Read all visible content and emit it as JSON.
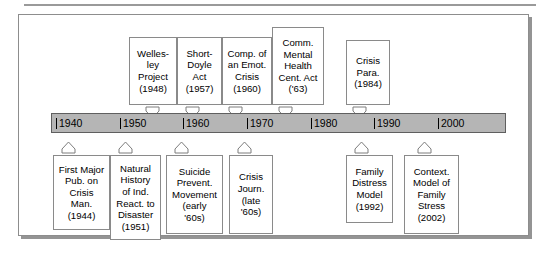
{
  "figure": {
    "bar_color": "#b5b5b5",
    "bar_border_color": "#5f5f5f",
    "box_border_color": "#8a8a8a",
    "frame_border_color": "#8d8d8d",
    "text_color": "#000000"
  },
  "timeline": {
    "ticks": [
      {
        "label": "1940",
        "left": 4
      },
      {
        "label": "1950",
        "left": 68
      },
      {
        "label": "1960",
        "left": 131
      },
      {
        "label": "1970",
        "left": 195
      },
      {
        "label": "1980",
        "left": 259
      },
      {
        "label": "1990",
        "left": 322
      },
      {
        "label": "2000",
        "left": 386
      }
    ]
  },
  "events_above": [
    {
      "name": "wellesley-project",
      "lines": [
        "Welles-",
        "ley",
        "Project",
        "(1948)"
      ],
      "year": "1948",
      "left": 110,
      "top": 22,
      "width": 48,
      "height": 68,
      "arrow_left": 126
    },
    {
      "name": "short-doyle-act",
      "lines": [
        "Short-",
        "Doyle",
        "Act",
        "(1957)"
      ],
      "year": "1957",
      "left": 158,
      "top": 22,
      "width": 45,
      "height": 68,
      "arrow_left": 166
    },
    {
      "name": "components-of-an-emotional-crisis",
      "lines": [
        "Comp. of",
        "an Emot.",
        "Crisis",
        "(1960)"
      ],
      "year": "1960",
      "left": 203,
      "top": 22,
      "width": 50,
      "height": 68,
      "arrow_left": 209
    },
    {
      "name": "community-mental-health-centers-act",
      "lines": [
        "Comm.",
        "Mental",
        "Health",
        "Cent. Act",
        "('63)"
      ],
      "year": "'63",
      "left": 253,
      "top": 12,
      "width": 52,
      "height": 78,
      "arrow_left": 259
    },
    {
      "name": "crisis-paradigm",
      "lines": [
        "Crisis",
        "Para.",
        "(1984)"
      ],
      "year": "1984",
      "left": 327,
      "top": 25,
      "width": 44,
      "height": 65,
      "arrow_left": 333
    }
  ],
  "events_below": [
    {
      "name": "first-major-publication-on-crisis-management",
      "lines": [
        "First Major",
        "Pub. on",
        "Crisis",
        "Man.",
        "(1944)"
      ],
      "year": "1944",
      "left": 34,
      "top": 140,
      "width": 57,
      "height": 75,
      "arrow_left": 42
    },
    {
      "name": "natural-history-of-individual-reactions-to-disaster",
      "lines": [
        "Natural",
        "History",
        "of Ind.",
        "React. to",
        "Disaster",
        "(1951)"
      ],
      "year": "1951",
      "left": 91,
      "top": 140,
      "width": 51,
      "height": 85,
      "arrow_left": 99
    },
    {
      "name": "suicide-prevention-movement",
      "lines": [
        "Suicide",
        "Prevent.",
        "Movement",
        "(early",
        "'60s)"
      ],
      "year": "early '60s",
      "left": 147,
      "top": 140,
      "width": 57,
      "height": 79,
      "arrow_left": 155
    },
    {
      "name": "crisis-journal",
      "lines": [
        "Crisis",
        "Journ.",
        "(late",
        "'60s)"
      ],
      "year": "late '60s",
      "left": 210,
      "top": 140,
      "width": 44,
      "height": 79,
      "arrow_left": 218
    },
    {
      "name": "family-distress-model",
      "lines": [
        "Family",
        "Distress",
        "Model",
        "(1992)"
      ],
      "year": "1992",
      "left": 327,
      "top": 140,
      "width": 47,
      "height": 68,
      "arrow_left": 335
    },
    {
      "name": "contextual-model-of-family-stress",
      "lines": [
        "Context.",
        "Model of",
        "Family",
        "Stress",
        "(2002)"
      ],
      "year": "2002",
      "left": 385,
      "top": 140,
      "width": 55,
      "height": 79,
      "arrow_left": 398
    }
  ]
}
